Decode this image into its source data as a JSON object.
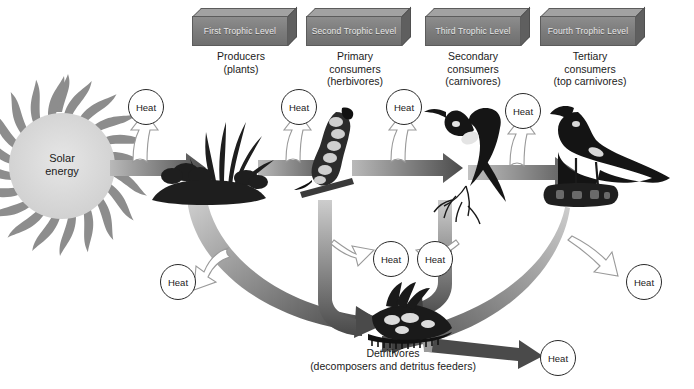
{
  "figure": {
    "background_color": "#ffffff",
    "solar": {
      "label": "Solar\nenergy",
      "disc_color": "#d9d9d9",
      "ray_color": "#8a8a8a"
    },
    "trophic_boxes": [
      {
        "id": "first",
        "label": "First Trophic\nLevel",
        "x": 192,
        "y": 8,
        "w": 96,
        "fill": "#7b7b7b",
        "text_color": "#e9e9e9"
      },
      {
        "id": "second",
        "label": "Second Trophic\nLevel",
        "x": 306,
        "y": 8,
        "w": 96,
        "fill": "#7b7b7b",
        "text_color": "#e9e9e9"
      },
      {
        "id": "third",
        "label": "Third Trophic\nLevel",
        "x": 425,
        "y": 8,
        "w": 96,
        "fill": "#7b7b7b",
        "text_color": "#e9e9e9"
      },
      {
        "id": "fourth",
        "label": "Fourth Trophic\nLevel",
        "x": 540,
        "y": 8,
        "w": 96,
        "fill": "#7b7b7b",
        "text_color": "#e9e9e9"
      }
    ],
    "captions": [
      {
        "id": "producers",
        "label": "Producers\n(plants)",
        "x": 186,
        "y": 50,
        "w": 110
      },
      {
        "id": "primary-consumers",
        "label": "Primary\nconsumers\n(herbivores)",
        "x": 300,
        "y": 50,
        "w": 110
      },
      {
        "id": "secondary-consumers",
        "label": "Secondary\nconsumers\n(carnivores)",
        "x": 418,
        "y": 50,
        "w": 110
      },
      {
        "id": "tertiary-consumers",
        "label": "Tertiary\nconsumers\n(top carnivores)",
        "x": 530,
        "y": 50,
        "w": 120
      }
    ],
    "detritivores": {
      "label": "Detritivores\n(decomposers and detritus feeders)",
      "x": 268,
      "y": 347,
      "w": 250
    },
    "heat_bubbles": [
      {
        "id": "heat-producers",
        "label": "Heat",
        "x": 128,
        "y": 89
      },
      {
        "id": "heat-primary",
        "label": "Heat",
        "x": 281,
        "y": 89
      },
      {
        "id": "heat-secondary",
        "label": "Heat",
        "x": 386,
        "y": 89
      },
      {
        "id": "heat-tertiary",
        "label": "Heat",
        "x": 505,
        "y": 89
      },
      {
        "id": "heat-plant-decay",
        "label": "Heat",
        "x": 160,
        "y": 264
      },
      {
        "id": "heat-cater-decay",
        "label": "Heat",
        "x": 364,
        "y": 239
      },
      {
        "id": "heat-bird-decay",
        "label": "Heat",
        "x": 424,
        "y": 239
      },
      {
        "id": "heat-hawk-decay",
        "label": "Heat",
        "x": 626,
        "y": 264
      },
      {
        "id": "heat-detritivores",
        "label": "Heat",
        "x": 536,
        "y": 340
      }
    ],
    "organisms": [
      {
        "id": "plants",
        "name": "grass-and-shrub-cluster",
        "x": 150,
        "y": 100
      },
      {
        "id": "caterpillar",
        "name": "caterpillar",
        "x": 312,
        "y": 100
      },
      {
        "id": "songbird",
        "name": "perched-songbird",
        "x": 432,
        "y": 100
      },
      {
        "id": "hawk",
        "name": "hawk-on-log",
        "x": 548,
        "y": 100
      },
      {
        "id": "detritivores",
        "name": "detritus-cluster",
        "x": 358,
        "y": 300
      }
    ],
    "flow_arrows": {
      "chain_color_light": "#b5b5b5",
      "chain_color_dark": "#4a4a4a",
      "decay_color": "#6e6e6e",
      "heat_arrow_color": "#9a9a9a"
    }
  }
}
